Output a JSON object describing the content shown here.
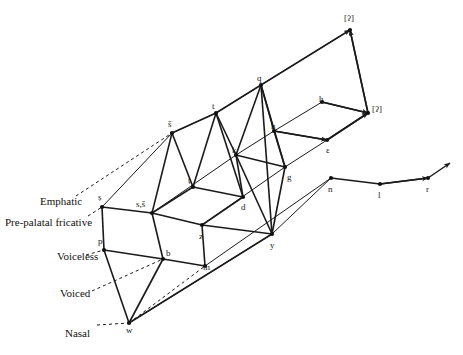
{
  "figure": {
    "type": "phonological-lattice-diagram",
    "width": 463,
    "height": 355,
    "background_color": "#ffffff",
    "stroke_color": "#1a1a1a"
  },
  "row_labels": [
    {
      "id": "emphatic",
      "text": "Emphatic",
      "x": 40,
      "y": 195
    },
    {
      "id": "pre-palatal-fricative",
      "text": "Pre-palatal fricative",
      "x": 5,
      "y": 216
    },
    {
      "id": "voiceless",
      "text": "Voiceless",
      "x": 57,
      "y": 250
    },
    {
      "id": "voiced",
      "text": "Voiced",
      "x": 60,
      "y": 287
    },
    {
      "id": "nasal",
      "text": "Nasal",
      "x": 65,
      "y": 327
    }
  ],
  "nodes": [
    {
      "id": "s-emphatic",
      "label": "ṣ",
      "x": 102,
      "y": 207,
      "lx": 98,
      "ly": 193
    },
    {
      "id": "s-sh",
      "label": "s,š",
      "x": 152,
      "y": 213,
      "lx": 136,
      "ly": 200
    },
    {
      "id": "sh-top",
      "label": "š",
      "x": 172,
      "y": 133,
      "lx": 168,
      "ly": 120
    },
    {
      "id": "t-emphatic",
      "label": "ṭ",
      "x": 193,
      "y": 187,
      "lx": 188,
      "ly": 176
    },
    {
      "id": "z",
      "label": "z",
      "x": 202,
      "y": 225,
      "lx": 199,
      "ly": 232
    },
    {
      "id": "t",
      "label": "t",
      "x": 216,
      "y": 113,
      "lx": 212,
      "ly": 102
    },
    {
      "id": "d",
      "label": "d",
      "x": 243,
      "y": 197,
      "lx": 241,
      "ly": 203
    },
    {
      "id": "k",
      "label": "k",
      "x": 236,
      "y": 155,
      "lx": 232,
      "ly": 146
    },
    {
      "id": "q",
      "label": "q",
      "x": 261,
      "y": 85,
      "lx": 257,
      "ly": 74
    },
    {
      "id": "g",
      "label": "g",
      "x": 285,
      "y": 167,
      "lx": 287,
      "ly": 173
    },
    {
      "id": "h-pharyngeal",
      "label": "ḥ",
      "x": 274,
      "y": 131,
      "lx": 271,
      "ly": 122
    },
    {
      "id": "y",
      "label": "y",
      "x": 272,
      "y": 234,
      "lx": 270,
      "ly": 241
    },
    {
      "id": "ayin",
      "label": "ε",
      "x": 327,
      "y": 140,
      "lx": 326,
      "ly": 146
    },
    {
      "id": "h",
      "label": "h",
      "x": 322,
      "y": 102,
      "lx": 319,
      "ly": 95
    },
    {
      "id": "glottal-stop-lower",
      "label": "[ʔ]",
      "x": 368,
      "y": 113,
      "lx": 372,
      "ly": 105
    },
    {
      "id": "glottal-stop-upper",
      "label": "[ʔ]",
      "x": 350,
      "y": 30,
      "lx": 344,
      "ly": 14
    },
    {
      "id": "p",
      "label": "p",
      "x": 104,
      "y": 250,
      "lx": 98,
      "ly": 237
    },
    {
      "id": "b",
      "label": "b",
      "x": 163,
      "y": 259,
      "lx": 166,
      "ly": 249
    },
    {
      "id": "m",
      "label": "m",
      "x": 205,
      "y": 266,
      "lx": 203,
      "ly": 263
    },
    {
      "id": "w",
      "label": "w",
      "x": 129,
      "y": 323,
      "lx": 126,
      "ly": 326
    },
    {
      "id": "n",
      "label": "n",
      "x": 331,
      "y": 178,
      "lx": 328,
      "ly": 185
    },
    {
      "id": "l",
      "label": "l",
      "x": 380,
      "y": 184,
      "lx": 378,
      "ly": 191
    },
    {
      "id": "r",
      "label": "r",
      "x": 428,
      "y": 178,
      "lx": 426,
      "ly": 185
    }
  ],
  "edges_solid": [
    "102,207 152,213",
    "152,213 202,225",
    "202,225 272,234",
    "152,213 172,133",
    "172,133 193,187",
    "193,187 152,213",
    "193,187 243,197",
    "193,187 216,113",
    "216,113 172,133",
    "216,113 243,197",
    "243,197 202,225",
    "216,113 236,155",
    "236,155 243,197",
    "236,155 261,85",
    "261,85 216,113",
    "236,155 285,167",
    "285,167 261,85",
    "261,85 274,131",
    "274,131 285,167",
    "274,131 327,140",
    "285,167 272,234",
    "261,85 272,234",
    "236,155 272,234",
    "322,102 368,113",
    "327,140 368,113",
    "368,113 350,30",
    "104,250 163,259",
    "163,259 205,266",
    "104,250 129,323",
    "163,259 129,323",
    "102,207 104,250",
    "152,213 163,259",
    "202,225 205,266",
    "272,234 129,323",
    "331,178 380,184",
    "380,184 428,178"
  ],
  "edges_rails": [
    "102,207 172,133",
    "172,133 216,113",
    "216,113 261,85",
    "261,85 350,30",
    "152,213 236,155",
    "236,155 274,131",
    "274,131 322,102",
    "202,225 285,167",
    "285,167 327,140",
    "205,266 331,178",
    "272,234 331,178",
    "129,323 272,234"
  ],
  "edges_dashed": [
    "88,216 102,207",
    "76,196 172,133",
    "86,255 104,250",
    "92,291 163,259",
    "97,325 129,323",
    "129,323 205,266"
  ],
  "arrows": [
    {
      "id": "arrow-to-glottal-upper",
      "from": "261,85",
      "to": "350,30"
    },
    {
      "id": "arrow-to-glottal-upper-vertical",
      "from": "368,113",
      "to": "350,30"
    },
    {
      "id": "arrow-to-glottal-lower-h",
      "from": "322,102",
      "to": "368,113"
    },
    {
      "id": "arrow-to-glottal-lower-ayin",
      "from": "327,140",
      "to": "368,113"
    },
    {
      "id": "arrow-to-r",
      "from": "380,184",
      "to": "428,178"
    },
    {
      "id": "arrow-right-tip",
      "from": "428,178",
      "to": "450,163"
    },
    {
      "id": "arrow-h-pharyngeal-to-ayin",
      "from": "274,131",
      "to": "327,140"
    }
  ]
}
